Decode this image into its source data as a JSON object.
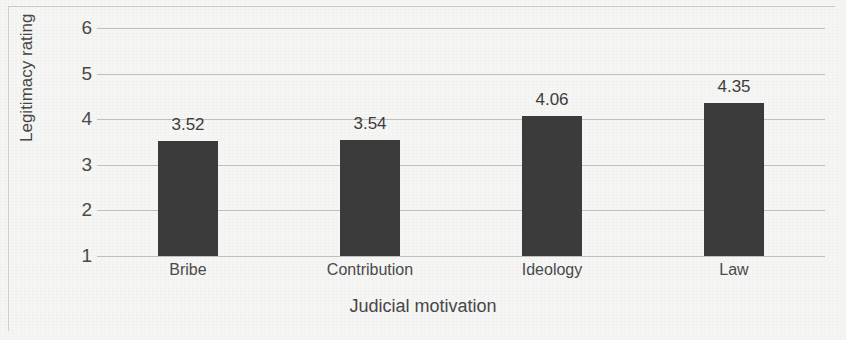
{
  "chart_data": {
    "type": "bar",
    "title": "",
    "categories": [
      "Bribe",
      "Contribution",
      "Ideology",
      "Law"
    ],
    "values": [
      3.52,
      3.54,
      4.06,
      4.35
    ],
    "value_labels": [
      "3.52",
      "3.54",
      "4.06",
      "4.35"
    ],
    "xlabel": "Judicial motivation",
    "ylabel": "Legitimacy rating",
    "ylim": [
      1,
      6
    ],
    "ytick_labels": [
      "1",
      "2",
      "3",
      "4",
      "5",
      "6"
    ],
    "ytick_values": [
      1,
      2,
      3,
      4,
      5,
      6
    ],
    "grid": true,
    "legend": false,
    "legend_position": "none",
    "bar_color": "#3b3b3b",
    "gridline_color": "#bfbfbf",
    "background_color": "#f6f6f5"
  }
}
